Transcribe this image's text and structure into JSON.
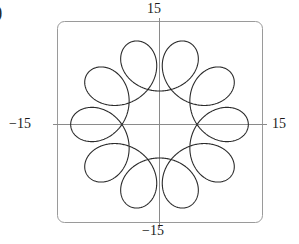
{
  "figure": {
    "part_label": ")",
    "axis_color": "#8a8a8a",
    "frame_color": "#9a9a9a",
    "curve_color": "#2b2b2b",
    "background": "#ffffff"
  },
  "labels": {
    "top": "15",
    "bottom": "−15",
    "left": "−15",
    "right": "15"
  },
  "chart_data": {
    "type": "line",
    "title": "",
    "subtitle": "",
    "xlabel": "",
    "ylabel": "",
    "xlim": [
      -15,
      15
    ],
    "ylim": [
      -15,
      15
    ],
    "xticks": [
      -15,
      15
    ],
    "yticks": [
      -15,
      15
    ],
    "xticklabels": [
      "−15",
      "15"
    ],
    "yticklabels": [
      "−15",
      "15"
    ],
    "grid": false,
    "legend": null,
    "legend_position": "none",
    "frame": "rounded-box",
    "axes_through_origin": true,
    "annotations": [
      ")"
    ],
    "series": [
      {
        "name": "hypotrochoid",
        "curve_family": "hypotrochoid",
        "parametric": {
          "x": "(R - r) * cos(t) + d * cos(((R - r) / r) * t)",
          "y": "(R - r) * sin(t) - d * sin(((R - r) / r) * t)",
          "R": 10,
          "r": 1,
          "d": 4,
          "loops": 9,
          "t_range": [
            0,
            6.283185307179586
          ],
          "samples": 2000
        },
        "outer_radius": 13,
        "inner_loop_radius": 5,
        "color": "#2b2b2b",
        "linewidth": 1.1
      }
    ]
  }
}
